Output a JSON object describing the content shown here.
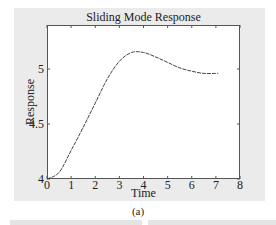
{
  "chart_data": {
    "type": "line",
    "title": "Sliding Mode Response",
    "xlabel": "Time",
    "ylabel": "Response",
    "xlim": [
      0,
      8
    ],
    "ylim": [
      4,
      5.4
    ],
    "xticks": [
      "0",
      "1",
      "2",
      "3",
      "4",
      "5",
      "6",
      "7",
      "8"
    ],
    "yticks": [
      "4",
      "4.5",
      "5"
    ],
    "grid": false,
    "series": [
      {
        "name": "response",
        "x": [
          0,
          0.5,
          1,
          1.5,
          2,
          2.5,
          3,
          3.5,
          4,
          4.5,
          5,
          5.5,
          6,
          6.5,
          7,
          7.1
        ],
        "y": [
          4.0,
          4.06,
          4.26,
          4.47,
          4.69,
          4.91,
          5.07,
          5.15,
          5.15,
          5.11,
          5.06,
          5.01,
          4.98,
          4.96,
          4.96,
          4.96
        ]
      }
    ]
  },
  "caption": "(a)"
}
